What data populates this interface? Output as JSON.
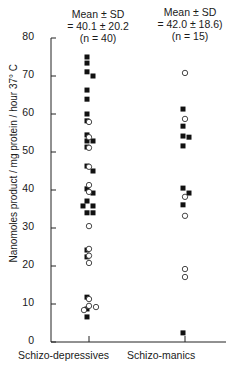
{
  "chart_data": {
    "type": "scatter",
    "title": "",
    "xlabel": "",
    "ylabel": "Nanomoles product / mg protein / hour 37° C",
    "ylim": [
      0,
      80
    ],
    "yticks": [
      0,
      10,
      20,
      30,
      40,
      50,
      60,
      70,
      80
    ],
    "grid": false,
    "legend": "none",
    "categories": [
      "Schizo-depressives",
      "Schizo-manics"
    ],
    "annotations": [
      {
        "category": "Schizo-depressives",
        "lines": [
          "Mean ± SD",
          "= 40.1 ± 20.2",
          "(n = 40)"
        ]
      },
      {
        "category": "Schizo-manics",
        "lines": [
          "Mean ± SD",
          "= 42.0 ± 18.6)",
          "(n = 15)"
        ]
      }
    ],
    "series": [
      {
        "name": "filled squares",
        "marker": "square-filled",
        "points": {
          "Schizo-depressives": [
            75.0,
            73.4,
            71.1,
            70.0,
            66.3,
            63.9,
            60.0,
            58.2,
            54.5,
            52.9,
            52.9,
            51.3,
            46.3,
            45.0,
            40.3,
            39.2,
            37.1,
            35.8,
            35.8,
            34.0,
            34.0,
            24.2,
            22.4,
            11.8,
            8.7,
            6.6
          ],
          "Schizo-manics": [
            61.3,
            56.8,
            53.9,
            54.2,
            51.6,
            40.5,
            39.2,
            36.1,
            2.4
          ]
        }
      },
      {
        "name": "open circles",
        "marker": "circle-open",
        "points": {
          "Schizo-depressives": [
            57.9,
            53.9,
            51.1,
            46.1,
            41.3,
            39.5,
            30.5,
            24.5,
            22.7,
            20.8,
            11.3,
            9.5,
            9.2,
            8.4
          ],
          "Schizo-manics": [
            70.8,
            58.7,
            38.2,
            33.2,
            19.2,
            17.1
          ]
        }
      }
    ]
  },
  "stats": {
    "a": {
      "line1": "Mean ± SD",
      "line2": "= 40.1 ± 20.2",
      "line3": "(n = 40)"
    },
    "b": {
      "line1": "Mean ± SD",
      "line2": "= 42.0 ± 18.6)",
      "line3": "(n = 15)"
    }
  },
  "axis": {
    "ylabel": "Nanomoles product / mg protein / hour 37° C",
    "ticks": [
      "0",
      "10",
      "20",
      "30",
      "40",
      "50",
      "60",
      "70",
      "80"
    ],
    "xcat1": "Schizo-depressives",
    "xcat2": "Schizo-manics"
  }
}
